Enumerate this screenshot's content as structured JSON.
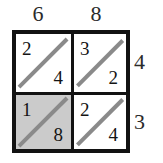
{
  "figure": {
    "colors": {
      "border": "#121212",
      "diagonal": "#8a8a8a",
      "shaded_cell": "#cbcbcb",
      "background": "#ffffff",
      "text": "#141414"
    }
  },
  "top_labels": [
    "6",
    "8"
  ],
  "right_labels": [
    "4",
    "3"
  ],
  "cells": [
    {
      "row": 0,
      "col": 0,
      "tens": "2",
      "ones": "4",
      "shaded": false
    },
    {
      "row": 0,
      "col": 1,
      "tens": "3",
      "ones": "2",
      "shaded": false
    },
    {
      "row": 1,
      "col": 0,
      "tens": "1",
      "ones": "8",
      "shaded": true
    },
    {
      "row": 1,
      "col": 1,
      "tens": "2",
      "ones": "4",
      "shaded": false
    }
  ]
}
